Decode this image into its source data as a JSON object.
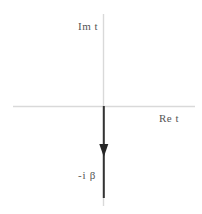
{
  "figure": {
    "name": "complex-t-plane-contour",
    "width": 202,
    "height": 214,
    "background_color": "#ffffff"
  },
  "axes": {
    "imaginary": {
      "label": "Im t",
      "icon": "vertical-axis-line",
      "color": "#d9d9d9",
      "x": 103.5,
      "y_start": 14,
      "y_end": 206
    },
    "real": {
      "label": "Re t",
      "icon": "horizontal-axis-line",
      "color": "#d9d9d9",
      "y": 106,
      "x_start": 13,
      "x_end": 195
    },
    "origin": {
      "x": 103.5,
      "y": 106
    }
  },
  "contour": {
    "name": "downward-arrow-contour",
    "label": "-i β",
    "color": "#333333",
    "line_width": 2,
    "x": 103.5,
    "y_start": 106,
    "y_end": 198,
    "arrowhead": {
      "icon": "arrowhead-down-icon",
      "apex_y": 157,
      "base_y": 144,
      "half_width": 4.5,
      "color": "#262626"
    }
  },
  "labels": {
    "im_t": "Im t",
    "re_t": "Re t",
    "neg_i_beta": "-i β"
  },
  "colors": {
    "axis": "#d9d9d9",
    "contour": "#333333",
    "text": "#555555",
    "background": "#ffffff"
  }
}
